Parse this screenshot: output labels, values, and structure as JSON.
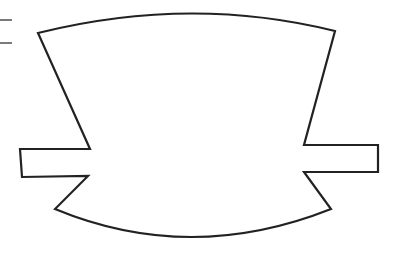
{
  "diagram": {
    "type": "outline-shape",
    "stroke_color": "#222222",
    "fill_color": "#ffffff",
    "background": "#ffffff",
    "stroke_width": 2.2,
    "margin_marks": [
      {
        "x1": 0,
        "y1": 20,
        "x2": 12,
        "y2": 20
      },
      {
        "x1": 0,
        "y1": 43,
        "x2": 12,
        "y2": 43
      }
    ],
    "shape_path": "M38,33 Q190,-5 335,31 L304,145 L378,145 L378,172 L304,172 L331,209 Q190,265 55,209 L88,176 L22,177 L20,149 L90,149 Z"
  }
}
